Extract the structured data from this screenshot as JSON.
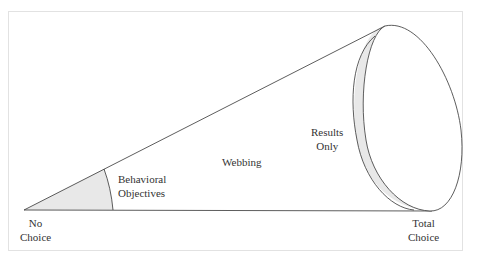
{
  "diagram": {
    "type": "cone-continuum",
    "colors": {
      "stroke": "#333333",
      "shade": "#e8e8e8",
      "frame": "#e2e2e2",
      "background": "#ffffff"
    },
    "axis": {
      "left_end": {
        "line1": "No",
        "line2": "Choice"
      },
      "right_end": {
        "line1": "Total",
        "line2": "Choice"
      }
    },
    "regions": [
      {
        "id": "behavioral-objectives",
        "line1": "Behavioral",
        "line2": "Objectives"
      },
      {
        "id": "webbing",
        "line1": "Webbing"
      },
      {
        "id": "results-only",
        "line1": "Results",
        "line2": "Only"
      }
    ]
  }
}
